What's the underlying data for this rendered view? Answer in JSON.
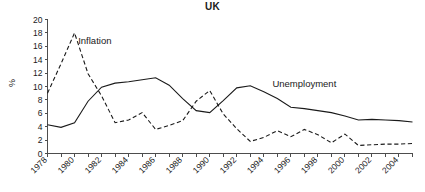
{
  "chart_data": {
    "type": "line",
    "title": "UK",
    "xlabel": "",
    "ylabel": "%",
    "ylim": [
      0,
      20
    ],
    "xlim": [
      1978,
      2005
    ],
    "ytick_step": 2,
    "yticks": [
      0,
      2,
      4,
      6,
      8,
      10,
      12,
      14,
      16,
      18,
      20
    ],
    "xticks": [
      1978,
      1980,
      1982,
      1984,
      1986,
      1988,
      1990,
      1992,
      1994,
      1996,
      1998,
      2000,
      2002,
      2004
    ],
    "x": [
      1978,
      1979,
      1980,
      1981,
      1982,
      1983,
      1984,
      1985,
      1986,
      1987,
      1988,
      1989,
      1990,
      1991,
      1992,
      1993,
      1994,
      1995,
      1996,
      1997,
      1998,
      1999,
      2000,
      2001,
      2002,
      2003,
      2004,
      2005
    ],
    "grid": false,
    "legend_position": "inline-annotation",
    "series": [
      {
        "name": "Inflation",
        "style": "dashed",
        "color": "#1a1a1a",
        "label_x": 1981.5,
        "label_y": 16.4,
        "values": [
          9.0,
          13.4,
          18.0,
          11.9,
          8.6,
          4.6,
          5.0,
          6.1,
          3.6,
          4.2,
          4.9,
          7.8,
          9.4,
          5.9,
          3.7,
          1.8,
          2.4,
          3.4,
          2.5,
          3.6,
          2.8,
          1.6,
          2.9,
          1.2,
          1.3,
          1.4,
          1.4,
          1.5
        ]
      },
      {
        "name": "Unemployment",
        "style": "solid",
        "color": "#1a1a1a",
        "label_x": 1997.0,
        "label_y": 10.0,
        "values": [
          4.3,
          3.9,
          4.6,
          7.8,
          9.9,
          10.5,
          10.7,
          11.0,
          11.3,
          10.2,
          8.2,
          6.4,
          6.1,
          7.9,
          9.8,
          10.1,
          9.2,
          8.2,
          6.9,
          6.7,
          6.4,
          6.1,
          5.6,
          5.0,
          5.1,
          5.0,
          4.9,
          4.7
        ]
      }
    ]
  }
}
